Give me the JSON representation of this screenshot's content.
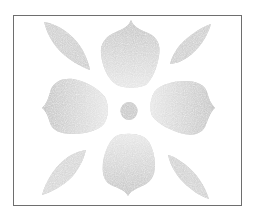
{
  "artwork": {
    "kind": "stencil-pattern",
    "motif": "four-petal flower with diagonal leaves",
    "elements": [
      {
        "name": "top-petal"
      },
      {
        "name": "bottom-petal"
      },
      {
        "name": "left-petal"
      },
      {
        "name": "right-petal"
      },
      {
        "name": "top-left-leaf"
      },
      {
        "name": "top-right-leaf"
      },
      {
        "name": "bottom-left-leaf"
      },
      {
        "name": "bottom-right-leaf"
      },
      {
        "name": "center-dot"
      }
    ],
    "colors": {
      "fill": "#c4c4c4",
      "fill_light": "#e2e2e2",
      "frame": "#6e6e6e",
      "background": "#ffffff"
    }
  }
}
